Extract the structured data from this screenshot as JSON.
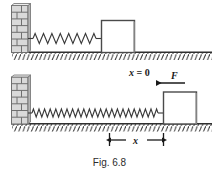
{
  "figure": {
    "caption": "Fig. 6.8",
    "panels": [
      {
        "name": "relaxed-spring-panel",
        "description": "Block at rest with spring at natural length attached to wall",
        "block_label": "",
        "spring_coils": 11,
        "state": "relaxed"
      },
      {
        "name": "stretched-spring-panel",
        "description": "Block displaced to the right, spring stretched, applied force F pointing left",
        "state": "stretched",
        "spring_coils": 24
      }
    ],
    "labels": {
      "origin_label": "x = 0",
      "origin_var": "x",
      "origin_eq": " = 0",
      "force_label": "F",
      "displacement_label": "x"
    },
    "colors": {
      "ink": "#1a1a1a",
      "line": "#3a3a3a",
      "shadow": "#7a7a7a",
      "wall_fill": "#d9d9d9",
      "wall_edge": "#8a8a8a",
      "block_fill": "#ffffff",
      "caption": "#2b2b2b",
      "background": "#ffffff"
    }
  }
}
